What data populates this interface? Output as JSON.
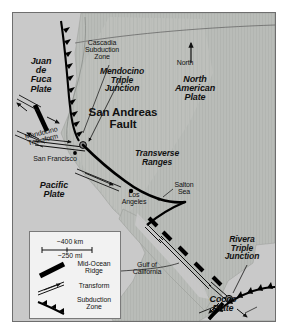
{
  "map": {
    "title": "Plate tectonic map of western North America",
    "colors": {
      "ocean": "#c9c9c9",
      "land": "#b9bcb8",
      "frame": "#6e6e6e",
      "fault": "#000000",
      "legend_bg": "#f2f2f2",
      "page_bg": "#ffffff"
    },
    "north_arrow": {
      "label": "North"
    },
    "plates": [
      {
        "name": "juan-de-fuca-plate",
        "label": "Juan\nde\nFuca\nPlate",
        "x": 16,
        "y": 46
      },
      {
        "name": "north-american-plate",
        "label": "North\nAmerican\nPlate",
        "x": 178,
        "y": 70
      },
      {
        "name": "pacific-plate",
        "label": "Pacific\nPlate",
        "x": 26,
        "y": 178
      },
      {
        "name": "cocos-plate",
        "label": "Cocos\nPlate",
        "x": 205,
        "y": 295
      }
    ],
    "features": [
      {
        "name": "cascadia-subduction-zone",
        "label": "Cascadia\nSubduction\nZone",
        "x": 70,
        "y": 38
      },
      {
        "name": "mendocino-triple-junction",
        "label": "Mendocino\nTriple\nJunction",
        "x": 93,
        "y": 64
      },
      {
        "name": "san-andreas-fault",
        "label": "San Andreas\nFault",
        "x": 100,
        "y": 104
      },
      {
        "name": "transverse-ranges",
        "label": "Transverse\nRanges",
        "x": 132,
        "y": 145
      },
      {
        "name": "mendocino-transform",
        "label": "Mendocino\nTransform",
        "x": 10,
        "y": 122
      },
      {
        "name": "rivera-triple-junction",
        "label": "Rivera\nTriple\nJunction",
        "x": 222,
        "y": 232
      }
    ],
    "places": [
      {
        "name": "san-francisco",
        "label": "San Francisco",
        "x": 28,
        "y": 146
      },
      {
        "name": "los-angeles",
        "label": "Los\nAngeles",
        "x": 126,
        "y": 186
      },
      {
        "name": "salton-sea",
        "label": "Salton\nSea",
        "x": 166,
        "y": 177
      },
      {
        "name": "gulf-of-california",
        "label": "Gulf of\nCalifornia",
        "x": 136,
        "y": 258
      }
    ],
    "legend": {
      "scale_km": "~400 km",
      "scale_mi": "~250 mi",
      "items": [
        {
          "name": "mid-ocean-ridge",
          "label": "Mid-Ocean\nRidge"
        },
        {
          "name": "transform",
          "label": "Transform"
        },
        {
          "name": "subduction-zone",
          "label": "Subduction\nZone"
        }
      ]
    }
  }
}
